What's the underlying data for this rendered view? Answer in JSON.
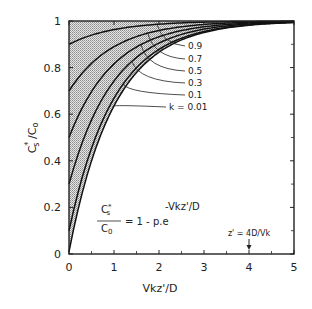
{
  "chart_data": {
    "type": "line",
    "title": "",
    "xlabel": "Vkz'/D",
    "ylabel": "C*s/C0",
    "xlim": [
      0,
      5
    ],
    "ylim": [
      0,
      1
    ],
    "x_ticks": [
      "0",
      "1",
      "2",
      "3",
      "4",
      "5"
    ],
    "y_ticks": [
      "0",
      "0.2",
      "0.4",
      "0.6",
      "0.8",
      "1"
    ],
    "grid": false,
    "equation": {
      "lhs_num": "C*s",
      "lhs_den": "C0",
      "rhs": "= 1 - p.e",
      "exponent": "-Vkz'/D"
    },
    "annotation": {
      "text": "z' = 4D/Vk",
      "x": 4,
      "arrow": true
    },
    "series": [
      {
        "name": "0.9",
        "k": 0.9,
        "x": [
          0,
          0.5,
          1,
          1.5,
          2,
          2.5,
          3,
          3.5,
          4,
          4.5,
          5
        ],
        "values": [
          0.9,
          0.939,
          0.963,
          0.978,
          0.986,
          0.992,
          0.995,
          0.997,
          0.998,
          0.999,
          0.999
        ]
      },
      {
        "name": "0.7",
        "k": 0.7,
        "x": [
          0,
          0.5,
          1,
          1.5,
          2,
          2.5,
          3,
          3.5,
          4,
          4.5,
          5
        ],
        "values": [
          0.7,
          0.818,
          0.89,
          0.933,
          0.959,
          0.975,
          0.985,
          0.991,
          0.995,
          0.997,
          0.998
        ]
      },
      {
        "name": "0.5",
        "k": 0.5,
        "x": [
          0,
          0.5,
          1,
          1.5,
          2,
          2.5,
          3,
          3.5,
          4,
          4.5,
          5
        ],
        "values": [
          0.5,
          0.697,
          0.816,
          0.888,
          0.932,
          0.959,
          0.975,
          0.985,
          0.991,
          0.994,
          0.997
        ]
      },
      {
        "name": "0.3",
        "k": 0.3,
        "x": [
          0,
          0.5,
          1,
          1.5,
          2,
          2.5,
          3,
          3.5,
          4,
          4.5,
          5
        ],
        "values": [
          0.3,
          0.575,
          0.742,
          0.844,
          0.905,
          0.943,
          0.965,
          0.979,
          0.987,
          0.992,
          0.995
        ]
      },
      {
        "name": "0.1",
        "k": 0.1,
        "x": [
          0,
          0.5,
          1,
          1.5,
          2,
          2.5,
          3,
          3.5,
          4,
          4.5,
          5
        ],
        "values": [
          0.1,
          0.454,
          0.669,
          0.799,
          0.878,
          0.926,
          0.955,
          0.973,
          0.984,
          0.99,
          0.994
        ]
      },
      {
        "name": "k = 0.01",
        "k": 0.01,
        "x": [
          0,
          0.5,
          1,
          1.5,
          2,
          2.5,
          3,
          3.5,
          4,
          4.5,
          5
        ],
        "values": [
          0.01,
          0.4,
          0.636,
          0.779,
          0.866,
          0.919,
          0.951,
          0.97,
          0.982,
          0.989,
          0.993
        ]
      }
    ],
    "shaded_region": "between k=0.01 curve and C*s/C0 = 1"
  }
}
